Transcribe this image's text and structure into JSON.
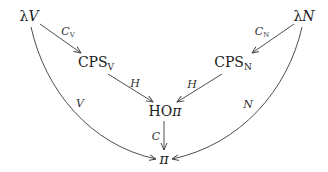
{
  "nodes": {
    "lambda_v": {
      "base": "λ",
      "var": "V"
    },
    "lambda_n": {
      "base": "λ",
      "var": "N"
    },
    "cps_v": {
      "base": "CPS",
      "sub": "V"
    },
    "cps_n": {
      "base": "CPS",
      "sub": "N"
    },
    "ho_pi": {
      "base": "HO",
      "var": "π"
    },
    "pi": {
      "var": "π"
    }
  },
  "edges": {
    "lambda_v_to_cps_v": {
      "label": "C",
      "sub": "V"
    },
    "lambda_n_to_cps_n": {
      "label": "C",
      "sub": "N"
    },
    "cps_v_to_ho_pi": {
      "label": "H"
    },
    "cps_n_to_ho_pi": {
      "label": "H"
    },
    "lambda_v_to_pi": {
      "label": "V"
    },
    "lambda_n_to_pi": {
      "label": "N"
    },
    "ho_pi_to_pi": {
      "label": "C"
    }
  },
  "colors": {
    "stroke": "#3a3a3a",
    "text": "#1a1a1a"
  }
}
